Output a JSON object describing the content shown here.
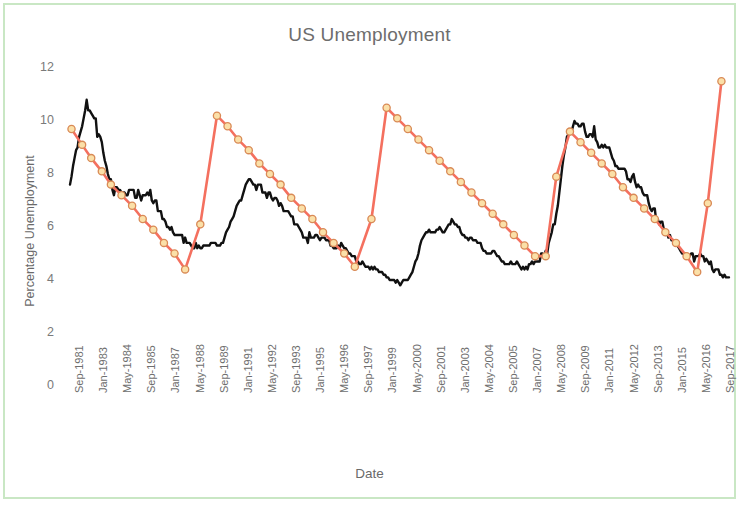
{
  "chart_data": {
    "type": "line",
    "title": "US Unemployment",
    "xlabel": "Date",
    "ylabel": "Percentage Unemployment",
    "ylim": [
      0,
      12
    ],
    "y_ticks": [
      0,
      2,
      4,
      6,
      8,
      10,
      12
    ],
    "grid": false,
    "legend": "none",
    "x_tick_labels": [
      "Sep-1981",
      "Jan-1983",
      "May-1984",
      "Sep-1985",
      "Jan-1987",
      "May-1988",
      "Sep-1989",
      "Jan-1991",
      "May-1992",
      "Sep-1993",
      "Jan-1995",
      "May-1996",
      "Sep-1997",
      "Jan-1999",
      "May-2000",
      "Sep-2001",
      "Jan-2003",
      "May-2004",
      "Sep-2005",
      "Jan-2007",
      "May-2008",
      "Sep-2009",
      "Jan-2011",
      "May-2012",
      "Sep-2013",
      "Jan-2015",
      "May-2016",
      "Sep-2017"
    ],
    "series": [
      {
        "name": "Actual unemployment",
        "color": "#111111",
        "style": "line",
        "marker": "none",
        "values": [
          7.6,
          7.9,
          8.3,
          8.6,
          8.9,
          9.0,
          9.4,
          9.6,
          9.8,
          10.1,
          10.4,
          10.8,
          10.4,
          10.4,
          10.3,
          10.2,
          10.1,
          10.1,
          9.4,
          9.5,
          9.4,
          9.2,
          8.8,
          8.5,
          8.3,
          8.0,
          7.8,
          7.8,
          7.4,
          7.2,
          7.5,
          7.5,
          7.4,
          7.4,
          7.3,
          7.3,
          7.3,
          7.2,
          7.2,
          7.4,
          7.4,
          7.4,
          7.4,
          7.1,
          7.1,
          7.4,
          7.2,
          7.0,
          7.2,
          7.2,
          7.2,
          7.3,
          7.2,
          7.4,
          7.0,
          6.9,
          7.0,
          7.0,
          6.6,
          6.6,
          6.6,
          6.3,
          6.3,
          6.2,
          6.0,
          6.0,
          5.9,
          6.0,
          5.8,
          5.7,
          5.7,
          5.7,
          5.7,
          5.7,
          5.7,
          5.4,
          5.6,
          5.4,
          5.4,
          5.4,
          5.3,
          5.2,
          5.2,
          5.4,
          5.2,
          5.3,
          5.2,
          5.2,
          5.3,
          5.3,
          5.3,
          5.3,
          5.3,
          5.4,
          5.4,
          5.4,
          5.4,
          5.3,
          5.3,
          5.3,
          5.4,
          5.4,
          5.6,
          5.8,
          5.9,
          6.0,
          6.2,
          6.3,
          6.4,
          6.6,
          6.8,
          6.9,
          7.0,
          7.0,
          7.2,
          7.4,
          7.6,
          7.7,
          7.8,
          7.8,
          7.7,
          7.6,
          7.6,
          7.4,
          7.6,
          7.6,
          7.6,
          7.3,
          7.3,
          7.3,
          7.1,
          7.3,
          7.3,
          7.1,
          7.0,
          7.1,
          7.1,
          7.0,
          6.8,
          6.9,
          6.8,
          6.6,
          6.6,
          6.6,
          6.6,
          6.5,
          6.4,
          6.4,
          6.1,
          6.1,
          6.1,
          6.0,
          5.9,
          5.8,
          5.6,
          5.6,
          5.6,
          5.4,
          5.8,
          5.6,
          5.6,
          5.6,
          5.7,
          5.7,
          5.6,
          5.5,
          5.6,
          5.6,
          5.6,
          5.5,
          5.5,
          5.5,
          5.3,
          5.3,
          5.2,
          5.2,
          5.2,
          5.3,
          5.2,
          5.4,
          5.3,
          5.2,
          5.2,
          5.1,
          5.0,
          5.0,
          4.9,
          4.9,
          4.9,
          4.7,
          4.7,
          4.6,
          4.6,
          4.7,
          4.6,
          4.5,
          4.5,
          4.5,
          4.4,
          4.5,
          4.4,
          4.5,
          4.4,
          4.4,
          4.3,
          4.3,
          4.3,
          4.2,
          4.2,
          4.1,
          4.1,
          4.0,
          4.0,
          4.0,
          4.0,
          3.9,
          4.0,
          3.9,
          3.8,
          3.9,
          4.0,
          4.0,
          4.0,
          4.0,
          4.1,
          4.2,
          4.3,
          4.5,
          4.7,
          4.8,
          5.0,
          5.3,
          5.5,
          5.6,
          5.7,
          5.8,
          5.8,
          5.9,
          5.8,
          5.8,
          5.8,
          5.8,
          5.9,
          5.9,
          6.0,
          5.9,
          5.8,
          5.8,
          5.9,
          6.0,
          6.1,
          6.1,
          6.3,
          6.2,
          6.1,
          6.1,
          6.0,
          6.0,
          5.8,
          5.7,
          5.7,
          5.6,
          5.6,
          5.5,
          5.6,
          5.6,
          5.5,
          5.5,
          5.5,
          5.4,
          5.4,
          5.4,
          5.2,
          5.1,
          5.1,
          5.0,
          5.0,
          5.0,
          5.0,
          5.1,
          5.1,
          5.0,
          4.9,
          4.9,
          4.8,
          4.7,
          4.7,
          4.6,
          4.6,
          4.6,
          4.6,
          4.7,
          4.6,
          4.6,
          4.6,
          4.7,
          4.6,
          4.5,
          4.4,
          4.5,
          4.4,
          4.5,
          4.4,
          4.6,
          4.6,
          4.7,
          4.6,
          4.7,
          4.7,
          4.7,
          4.7,
          5.0,
          5.0,
          4.9,
          5.1,
          5.0,
          5.4,
          5.6,
          5.8,
          6.1,
          6.1,
          6.5,
          6.8,
          7.3,
          7.8,
          8.3,
          8.7,
          9.0,
          9.4,
          9.5,
          9.5,
          9.6,
          9.8,
          10.0,
          9.9,
          9.9,
          9.8,
          9.8,
          9.9,
          9.9,
          9.6,
          9.4,
          9.4,
          9.5,
          9.5,
          9.4,
          9.8,
          9.3,
          9.2,
          9.0,
          9.0,
          9.1,
          9.0,
          9.1,
          9.0,
          9.0,
          9.0,
          8.8,
          8.6,
          8.5,
          8.3,
          8.3,
          8.2,
          8.2,
          8.2,
          8.2,
          8.2,
          8.1,
          7.8,
          7.8,
          7.7,
          7.9,
          8.0,
          7.7,
          7.5,
          7.6,
          7.5,
          7.5,
          7.3,
          7.2,
          7.2,
          7.2,
          6.9,
          6.7,
          6.6,
          6.7,
          6.7,
          6.2,
          6.3,
          6.1,
          6.2,
          6.2,
          5.9,
          5.7,
          5.8,
          5.6,
          5.7,
          5.5,
          5.5,
          5.4,
          5.5,
          5.3,
          5.2,
          5.1,
          5.0,
          5.0,
          5.0,
          5.0,
          4.9,
          4.9,
          5.0,
          5.0,
          4.7,
          4.9,
          4.9,
          4.9,
          5.0,
          4.9,
          4.9,
          4.7,
          4.8,
          4.7,
          4.6,
          4.7,
          4.4,
          4.3,
          4.4,
          4.4,
          4.4,
          4.2,
          4.2,
          4.1,
          4.2,
          4.1,
          4.1,
          4.1
        ]
      },
      {
        "name": "Cycle trend",
        "color": "#f4705f",
        "style": "line",
        "marker": "circle",
        "marker_face": "#fbe0a8",
        "marker_edge": "#d98a56",
        "vertices": [
          {
            "x_index": 1,
            "value": 9.7
          },
          {
            "x_index": 8,
            "value": 9.1
          },
          {
            "x_index": 14,
            "value": 8.6
          },
          {
            "x_index": 21,
            "value": 8.1
          },
          {
            "x_index": 27,
            "value": 7.6
          },
          {
            "x_index": 34,
            "value": 7.2
          },
          {
            "x_index": 41,
            "value": 6.8
          },
          {
            "x_index": 48,
            "value": 6.3
          },
          {
            "x_index": 55,
            "value": 5.9
          },
          {
            "x_index": 62,
            "value": 5.4
          },
          {
            "x_index": 69,
            "value": 5.0
          },
          {
            "x_index": 76,
            "value": 4.4
          },
          {
            "x_index": 86,
            "value": 6.1
          },
          {
            "x_index": 97,
            "value": 10.2
          },
          {
            "x_index": 104,
            "value": 9.8
          },
          {
            "x_index": 111,
            "value": 9.3
          },
          {
            "x_index": 118,
            "value": 8.9
          },
          {
            "x_index": 125,
            "value": 8.4
          },
          {
            "x_index": 132,
            "value": 8.0
          },
          {
            "x_index": 139,
            "value": 7.6
          },
          {
            "x_index": 146,
            "value": 7.1
          },
          {
            "x_index": 153,
            "value": 6.7
          },
          {
            "x_index": 160,
            "value": 6.3
          },
          {
            "x_index": 167,
            "value": 5.8
          },
          {
            "x_index": 174,
            "value": 5.4
          },
          {
            "x_index": 181,
            "value": 5.0
          },
          {
            "x_index": 188,
            "value": 4.5
          },
          {
            "x_index": 199,
            "value": 6.3
          },
          {
            "x_index": 209,
            "value": 10.5
          },
          {
            "x_index": 216,
            "value": 10.1
          },
          {
            "x_index": 223,
            "value": 9.7
          },
          {
            "x_index": 230,
            "value": 9.3
          },
          {
            "x_index": 237,
            "value": 8.9
          },
          {
            "x_index": 244,
            "value": 8.5
          },
          {
            "x_index": 251,
            "value": 8.1
          },
          {
            "x_index": 258,
            "value": 7.7
          },
          {
            "x_index": 265,
            "value": 7.3
          },
          {
            "x_index": 272,
            "value": 6.9
          },
          {
            "x_index": 279,
            "value": 6.5
          },
          {
            "x_index": 286,
            "value": 6.1
          },
          {
            "x_index": 293,
            "value": 5.7
          },
          {
            "x_index": 300,
            "value": 5.3
          },
          {
            "x_index": 307,
            "value": 4.9
          },
          {
            "x_index": 314,
            "value": 4.9
          },
          {
            "x_index": 321,
            "value": 7.9
          },
          {
            "x_index": 330,
            "value": 9.6
          },
          {
            "x_index": 337,
            "value": 9.2
          },
          {
            "x_index": 344,
            "value": 8.8
          },
          {
            "x_index": 351,
            "value": 8.4
          },
          {
            "x_index": 358,
            "value": 8.0
          },
          {
            "x_index": 365,
            "value": 7.5
          },
          {
            "x_index": 372,
            "value": 7.1
          },
          {
            "x_index": 379,
            "value": 6.7
          },
          {
            "x_index": 386,
            "value": 6.3
          },
          {
            "x_index": 393,
            "value": 5.8
          },
          {
            "x_index": 400,
            "value": 5.4
          },
          {
            "x_index": 407,
            "value": 4.9
          },
          {
            "x_index": 414,
            "value": 4.3
          },
          {
            "x_index": 421,
            "value": 6.9
          },
          {
            "x_index": 430,
            "value": 11.5
          }
        ]
      }
    ]
  },
  "colors": {
    "frame": "#c9e7c4",
    "title_text": "#6d6d6d",
    "tick_text": "#6e6e6e",
    "actual_line": "#111111",
    "trend_line": "#f4705f",
    "marker_fill": "#fbe0a8",
    "marker_stroke": "#d98a56",
    "background": "#ffffff"
  }
}
